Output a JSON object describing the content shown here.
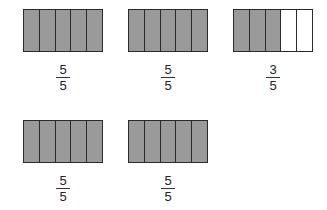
{
  "colors": {
    "shaded": "#9a9a9a",
    "unshaded": "#ffffff",
    "border": "#2a2a2a"
  },
  "models": [
    {
      "id": "m1",
      "parts": 5,
      "shaded": 5,
      "left": 23,
      "top": 9,
      "fraction": {
        "numerator": "5",
        "denominator": "5"
      }
    },
    {
      "id": "m2",
      "parts": 5,
      "shaded": 5,
      "left": 128,
      "top": 9,
      "fraction": {
        "numerator": "5",
        "denominator": "5"
      }
    },
    {
      "id": "m3",
      "parts": 5,
      "shaded": 3,
      "left": 233,
      "top": 9,
      "fraction": {
        "numerator": "3",
        "denominator": "5"
      }
    },
    {
      "id": "m4",
      "parts": 5,
      "shaded": 5,
      "left": 23,
      "top": 120,
      "fraction": {
        "numerator": "5",
        "denominator": "5"
      }
    },
    {
      "id": "m5",
      "parts": 5,
      "shaded": 5,
      "left": 128,
      "top": 120,
      "fraction": {
        "numerator": "5",
        "denominator": "5"
      }
    }
  ]
}
